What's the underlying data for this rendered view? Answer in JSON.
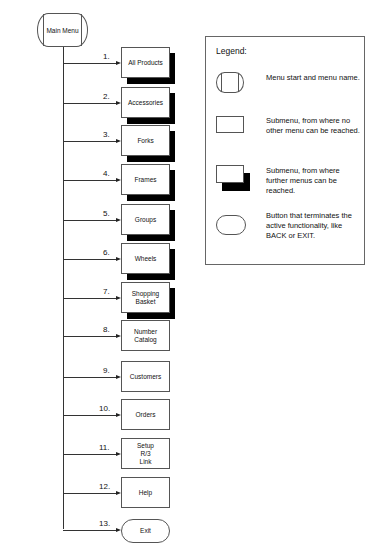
{
  "main_menu": {
    "label": "Main Menu"
  },
  "menu_items": [
    {
      "number": "1.",
      "label": "All Products",
      "type": "submenu-further"
    },
    {
      "number": "2.",
      "label": "Accessories",
      "type": "submenu-further"
    },
    {
      "number": "3.",
      "label": "Forks",
      "type": "submenu-further"
    },
    {
      "number": "4.",
      "label": "Frames",
      "type": "submenu-further"
    },
    {
      "number": "5.",
      "label": "Groups",
      "type": "submenu-further"
    },
    {
      "number": "6.",
      "label": "Wheels",
      "type": "submenu-further"
    },
    {
      "number": "7.",
      "label": "Shopping Basket",
      "type": "submenu-further"
    },
    {
      "number": "8.",
      "label": "Number Catalog",
      "type": "submenu"
    },
    {
      "number": "9.",
      "label": "Customers",
      "type": "submenu"
    },
    {
      "number": "10.",
      "label": "Orders",
      "type": "submenu"
    },
    {
      "number": "11.",
      "label": "Setup R/3 Link",
      "type": "submenu"
    },
    {
      "number": "12.",
      "label": "Help",
      "type": "submenu"
    },
    {
      "number": "13.",
      "label": "Exit",
      "type": "terminate-button"
    }
  ],
  "legend": {
    "title": "Legend:",
    "entries": [
      {
        "icon": "menu-start-icon",
        "text": "Menu start and menu name."
      },
      {
        "icon": "submenu-icon",
        "text": "Submenu, from where no other menu can be reached."
      },
      {
        "icon": "submenu-further-icon",
        "text": "Submenu, from where further menus can be reached."
      },
      {
        "icon": "terminate-button-icon",
        "text": "Button that terminates the active functionality, like BACK or EXIT."
      }
    ]
  }
}
